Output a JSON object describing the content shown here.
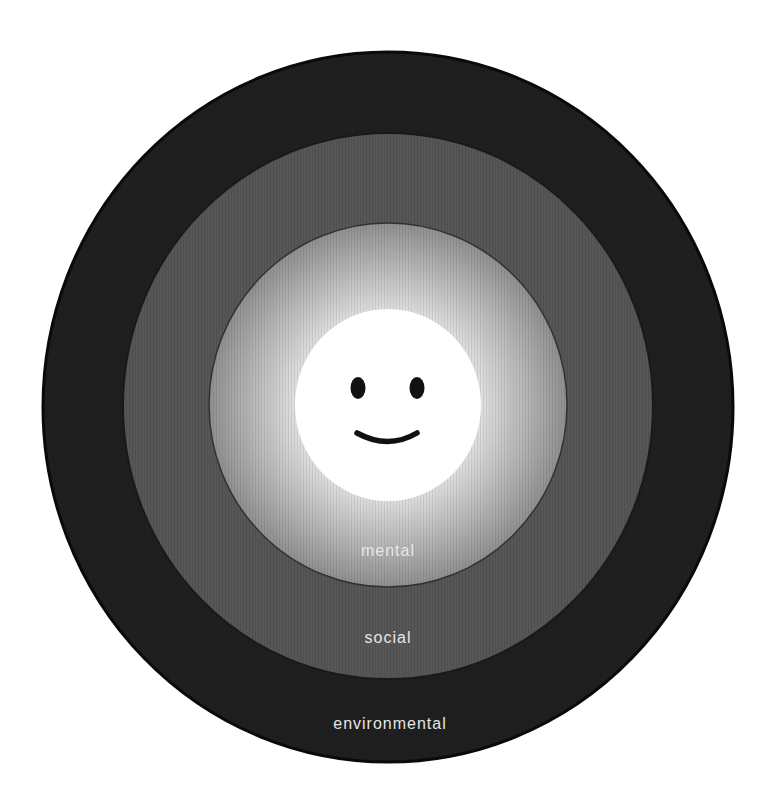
{
  "diagram": {
    "type": "concentric-circles",
    "center_icon": "smiley-face-icon",
    "rings": [
      {
        "label": "environmental",
        "color": "#1f1f1f",
        "outline": "#0a0a0a"
      },
      {
        "label": "social",
        "color": "#555555",
        "outline": "#222222"
      },
      {
        "label": "mental",
        "color": "#9a9a9a",
        "color_inner": "#e4e4e4",
        "outline": "#3a3a3a"
      }
    ],
    "core": {
      "color": "#ffffff",
      "feature_color": "#111111"
    }
  }
}
